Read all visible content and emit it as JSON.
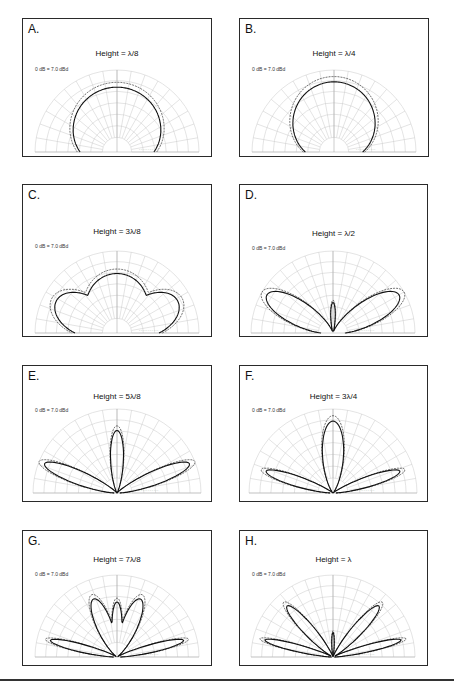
{
  "figure": {
    "reference_label": "0 dB = 7.0 dBd",
    "panels": [
      {
        "letter": "A.",
        "title": "Height = λ/8"
      },
      {
        "letter": "B.",
        "title": "Height = λ/4"
      },
      {
        "letter": "C.",
        "title": "Height = 3λ/8"
      },
      {
        "letter": "D.",
        "title": "Height = λ/2"
      },
      {
        "letter": "E.",
        "title": "Height = 5λ/8"
      },
      {
        "letter": "F.",
        "title": "Height = 3λ/4"
      },
      {
        "letter": "G.",
        "title": "Height = 7λ/8"
      },
      {
        "letter": "H.",
        "title": "Height = λ"
      }
    ],
    "caption": ""
  },
  "chart_data": [
    {
      "type": "polar",
      "panel": "A",
      "title": "Height = λ/8",
      "reference": "0 dB = 7.0 dBd",
      "angular_range_deg": [
        0,
        180
      ],
      "lobes": [
        {
          "direction_deg": 90,
          "relative_level": 0.85
        }
      ],
      "series": [
        {
          "name": "solid",
          "style": "solid"
        },
        {
          "name": "dashed",
          "style": "dashed",
          "relative_level": 1.0
        }
      ]
    },
    {
      "type": "polar",
      "panel": "B",
      "title": "Height = λ/4",
      "reference": "0 dB = 7.0 dBd",
      "angular_range_deg": [
        0,
        180
      ],
      "lobes": [
        {
          "direction_deg": 90,
          "relative_level": 0.92
        }
      ],
      "series": [
        {
          "name": "solid",
          "style": "solid"
        },
        {
          "name": "dashed",
          "style": "dashed"
        }
      ]
    },
    {
      "type": "polar",
      "panel": "C",
      "title": "Height = 3λ/8",
      "reference": "0 dB = 7.0 dBd",
      "angular_range_deg": [
        0,
        180
      ],
      "lobes": [
        {
          "direction_deg": 90,
          "relative_level": 0.78
        },
        {
          "direction_deg": 30,
          "relative_level": 0.9
        },
        {
          "direction_deg": 150,
          "relative_level": 0.9
        }
      ],
      "series": [
        {
          "name": "solid",
          "style": "solid"
        },
        {
          "name": "dashed",
          "style": "dashed"
        }
      ]
    },
    {
      "type": "polar",
      "panel": "D",
      "title": "Height = λ/2",
      "reference": "0 dB = 7.0 dBd",
      "angular_range_deg": [
        0,
        180
      ],
      "lobes": [
        {
          "direction_deg": 30,
          "relative_level": 1.0
        },
        {
          "direction_deg": 150,
          "relative_level": 1.0
        },
        {
          "direction_deg": 90,
          "relative_level": 0.4
        }
      ],
      "series": [
        {
          "name": "solid",
          "style": "solid"
        },
        {
          "name": "dashed",
          "style": "dashed"
        }
      ]
    },
    {
      "type": "polar",
      "panel": "E",
      "title": "Height = 5λ/8",
      "reference": "0 dB = 7.0 dBd",
      "angular_range_deg": [
        0,
        180
      ],
      "lobes": [
        {
          "direction_deg": 90,
          "relative_level": 0.8
        },
        {
          "direction_deg": 22,
          "relative_level": 1.0
        },
        {
          "direction_deg": 158,
          "relative_level": 1.0
        }
      ],
      "series": [
        {
          "name": "solid",
          "style": "solid"
        },
        {
          "name": "dashed",
          "style": "dashed"
        }
      ]
    },
    {
      "type": "polar",
      "panel": "F",
      "title": "Height = 3λ/4",
      "reference": "0 dB = 7.0 dBd",
      "angular_range_deg": [
        0,
        180
      ],
      "lobes": [
        {
          "direction_deg": 90,
          "relative_level": 0.92
        },
        {
          "direction_deg": 18,
          "relative_level": 0.9
        },
        {
          "direction_deg": 162,
          "relative_level": 0.9
        }
      ],
      "series": [
        {
          "name": "solid",
          "style": "solid"
        },
        {
          "name": "dashed",
          "style": "dashed"
        }
      ]
    },
    {
      "type": "polar",
      "panel": "G",
      "title": "Height = 7λ/8",
      "reference": "0 dB = 7.0 dBd",
      "angular_range_deg": [
        0,
        180
      ],
      "lobes": [
        {
          "direction_deg": 65,
          "relative_level": 0.82
        },
        {
          "direction_deg": 115,
          "relative_level": 0.82
        },
        {
          "direction_deg": 15,
          "relative_level": 0.9
        },
        {
          "direction_deg": 165,
          "relative_level": 0.9
        }
      ],
      "series": [
        {
          "name": "solid",
          "style": "solid"
        },
        {
          "name": "dashed",
          "style": "dashed"
        }
      ]
    },
    {
      "type": "polar",
      "panel": "H",
      "title": "Height = λ",
      "reference": "0 dB = 7.0 dBd",
      "angular_range_deg": [
        0,
        180
      ],
      "lobes": [
        {
          "direction_deg": 48,
          "relative_level": 0.9
        },
        {
          "direction_deg": 132,
          "relative_level": 0.9
        },
        {
          "direction_deg": 15,
          "relative_level": 0.92
        },
        {
          "direction_deg": 165,
          "relative_level": 0.92
        },
        {
          "direction_deg": 90,
          "relative_level": 0.3
        }
      ],
      "series": [
        {
          "name": "solid",
          "style": "solid"
        },
        {
          "name": "dashed",
          "style": "dashed"
        }
      ]
    }
  ]
}
